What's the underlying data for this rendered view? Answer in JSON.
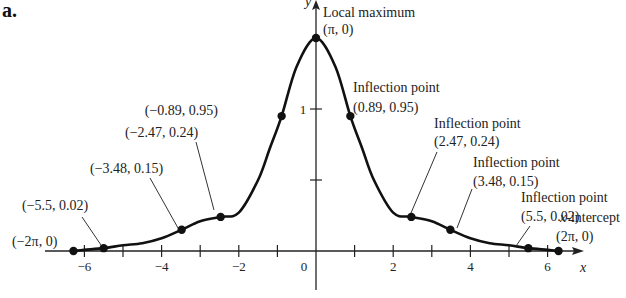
{
  "panel_label": "a.",
  "chart_data": {
    "type": "line",
    "title": "",
    "xlabel": "x",
    "ylabel": "y",
    "xlim": [
      -6.8,
      6.8
    ],
    "ylim": [
      -0.3,
      1.75
    ],
    "grid": false,
    "x_ticks": [
      -6,
      -5,
      -4,
      -3,
      -2,
      -1,
      1,
      2,
      3,
      4,
      5,
      6
    ],
    "x_tick_labels": [
      {
        "x": -6,
        "label": "−6"
      },
      {
        "x": -4,
        "label": "−4"
      },
      {
        "x": -2,
        "label": "−2"
      },
      {
        "x": 0,
        "label": "0"
      },
      {
        "x": 2,
        "label": "2"
      },
      {
        "x": 4,
        "label": "4"
      },
      {
        "x": 6,
        "label": "6"
      }
    ],
    "y_ticks": [
      0.5,
      1
    ],
    "y_tick_labels": [
      {
        "y": 1,
        "label": "1"
      }
    ],
    "curve_samples": {
      "x": [
        -6.2832,
        -6.0,
        -5.5,
        -5.0,
        -4.5,
        -4.0,
        -3.48,
        -3.0,
        -2.47,
        -2.0,
        -1.5,
        -1.2,
        -0.89,
        -0.5,
        0,
        0.5,
        0.89,
        1.2,
        1.5,
        2.0,
        2.47,
        3.0,
        3.48,
        4.0,
        4.5,
        5.0,
        5.5,
        6.0,
        6.2832
      ],
      "y": [
        0,
        0.008,
        0.02,
        0.04,
        0.055,
        0.09,
        0.15,
        0.21,
        0.24,
        0.27,
        0.5,
        0.72,
        0.95,
        1.3,
        1.5,
        1.3,
        0.95,
        0.72,
        0.5,
        0.27,
        0.24,
        0.21,
        0.15,
        0.09,
        0.055,
        0.04,
        0.02,
        0.008,
        0
      ]
    },
    "points": [
      {
        "x": -6.2832,
        "y": 0,
        "label": "(−2π, 0)",
        "caption": ""
      },
      {
        "x": -5.5,
        "y": 0.02,
        "label": "(−5.5, 0.02)",
        "caption": ""
      },
      {
        "x": -3.48,
        "y": 0.15,
        "label": "(−3.48, 0.15)",
        "caption": ""
      },
      {
        "x": -2.47,
        "y": 0.24,
        "label": "(−2.47, 0.24)",
        "caption": ""
      },
      {
        "x": -0.89,
        "y": 0.95,
        "label": "(−0.89, 0.95)",
        "caption": ""
      },
      {
        "x": 0,
        "y": 1.5,
        "label": "(π, 0)",
        "caption": "Local maximum"
      },
      {
        "x": 0.89,
        "y": 0.95,
        "label": "(0.89, 0.95)",
        "caption": "Inflection point"
      },
      {
        "x": 2.47,
        "y": 0.24,
        "label": "(2.47, 0.24)",
        "caption": "Inflection point"
      },
      {
        "x": 3.48,
        "y": 0.15,
        "label": "(3.48, 0.15)",
        "caption": "Inflection point"
      },
      {
        "x": 5.5,
        "y": 0.02,
        "label": "(5.5, 0.02)",
        "caption": "Inflection point"
      },
      {
        "x": 6.2832,
        "y": 0,
        "label": "(2π, 0)",
        "caption": "x-intercept"
      }
    ],
    "annotations": [
      "Local maximum (π, 0)",
      "Inflection point (0.89, 0.95)",
      "Inflection point (2.47, 0.24)",
      "Inflection point (3.48, 0.15)",
      "Inflection point (5.5, 0.02)",
      "x-intercept (2π, 0)",
      "(−0.89, 0.95)",
      "(−2.47, 0.24)",
      "(−3.48, 0.15)",
      "(−5.5, 0.02)",
      "(−2π, 0)"
    ]
  }
}
